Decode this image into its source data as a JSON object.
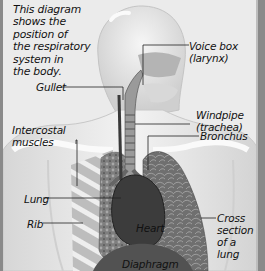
{
  "diagram": {
    "title": "Respiratory system",
    "intro_text": "This diagram\nshows the\nposition of\nthe respiratory\nsystem in\nthe body.",
    "labels": {
      "voice_box": "Voice box\n(larynx)",
      "gullet": "Gullet",
      "windpipe": "Windpipe\n(trachea)",
      "bronchus": "Bronchus",
      "intercostal": "Intercostal\nmuscles",
      "lung": "Lung",
      "rib": "Rib",
      "heart": "Heart",
      "cross_section": "Cross\nsection\nof a lung",
      "diaphragm": "Diaphragm"
    },
    "colors": {
      "background": "#ebebeb",
      "frame": "#8a8a8a",
      "body_outline": "#d9d9d9",
      "lung_tissue": "#8c8c8c",
      "heart": "#3a3a3a",
      "leader_line": "#222222"
    }
  }
}
